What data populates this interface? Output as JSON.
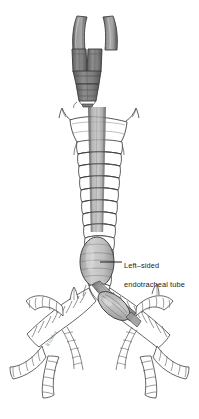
{
  "figure": {
    "background_color": "#ffffff",
    "outline_color": "#3a3a3a",
    "airway_fill": "#ffffff",
    "tube_fill_light": "#b9b9b9",
    "tube_fill_mid": "#8f8f8f",
    "tube_fill_dark": "#6e6e6e",
    "connector_fill": "#7d7d7d",
    "cuff_fill": "#c2c2c2",
    "label_color": "#222222",
    "leader_color": "#1f1f1f"
  },
  "callout": {
    "line1": "Left–sided",
    "line2": "endotracheal tube",
    "full_text": "Left–sided endotracheal tube",
    "leader_from_x": 100,
    "leader_from_y": 262,
    "leader_to_x": 122,
    "leader_to_y": 262
  },
  "signature": {
    "text": "Rhodes"
  },
  "anatomy": {
    "parts": [
      {
        "name": "proximal-tube-limb-left",
        "description": "Left proximal connector limb of double-lumen tube"
      },
      {
        "name": "proximal-tube-limb-right",
        "description": "Right proximal connector limb of double-lumen tube"
      },
      {
        "name": "y-connector",
        "description": "Y-piece connector body joining both lumens"
      },
      {
        "name": "connector-adapter",
        "description": "Tapered 15 mm adapter below the Y-piece"
      },
      {
        "name": "larynx",
        "description": "Thyroid and cricoid cartilage with lateral cornua"
      },
      {
        "name": "trachea",
        "description": "Tracheal cartilage rings"
      },
      {
        "name": "tracheal-cuff",
        "description": "Inflated tracheal cuff (balloon)"
      },
      {
        "name": "carina",
        "description": "Bifurcation of the trachea"
      },
      {
        "name": "left-mainstem-bronchus",
        "description": "Left main bronchus containing distal tube tip"
      },
      {
        "name": "right-mainstem-bronchus",
        "description": "Right main bronchus"
      },
      {
        "name": "bronchial-cuff",
        "description": "Inflated bronchial cuff in left mainstem bronchus"
      },
      {
        "name": "lobar-bronchi",
        "description": "Distal lobar and segmental bronchial branches"
      }
    ]
  }
}
